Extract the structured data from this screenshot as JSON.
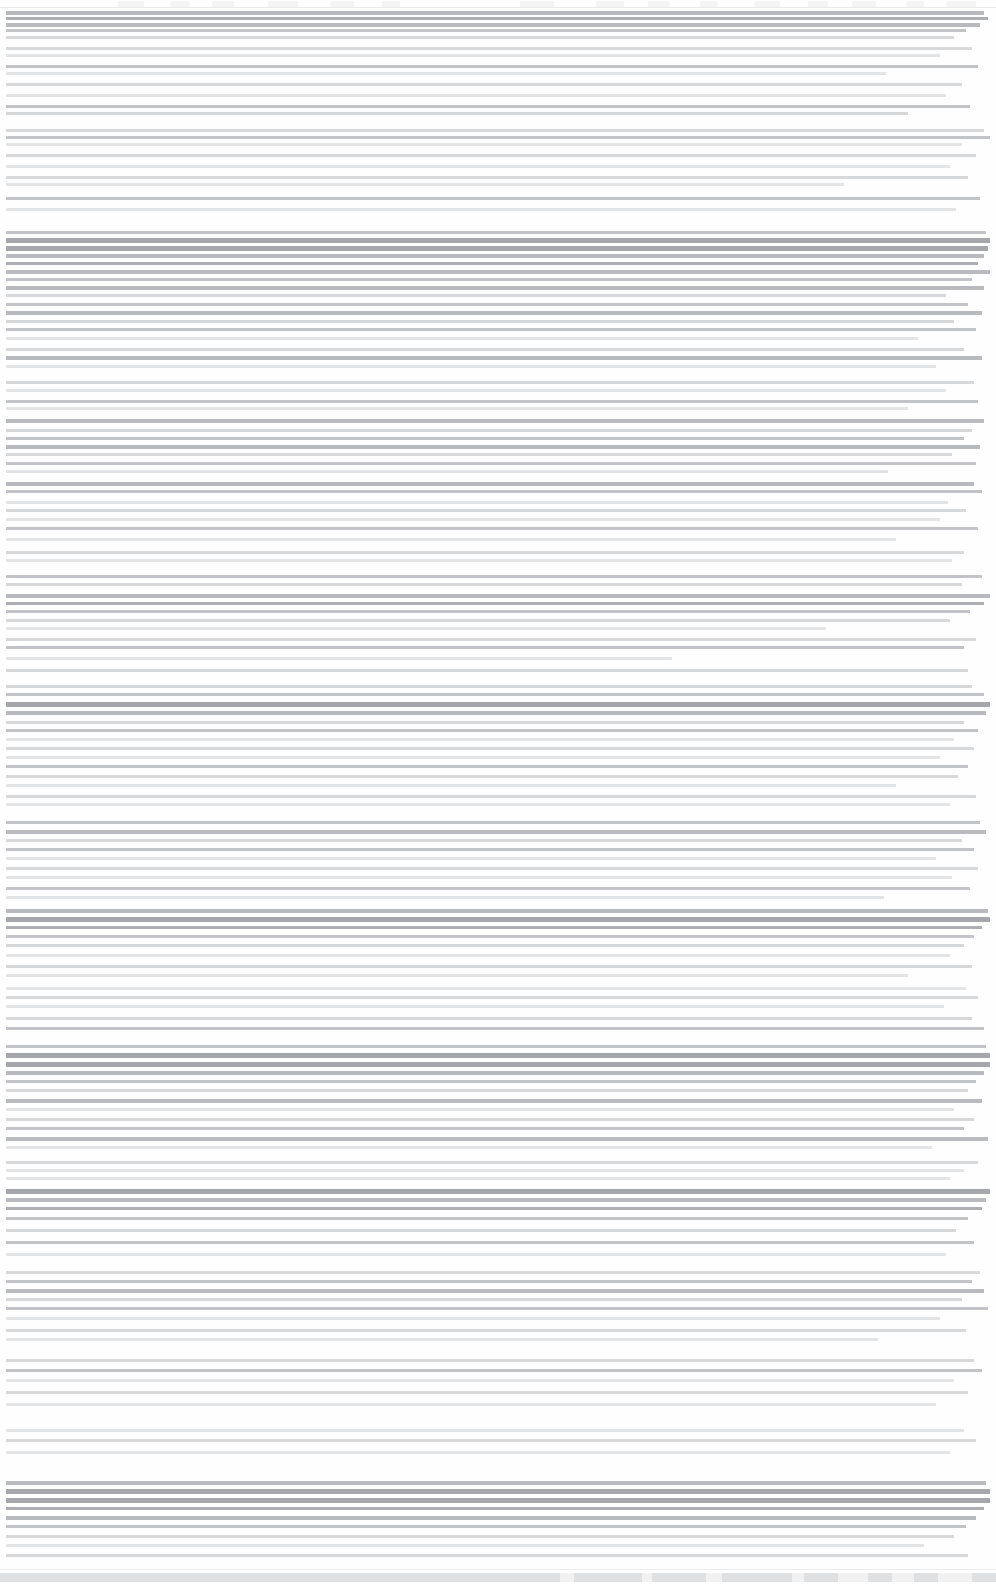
{
  "document": {
    "title": "",
    "legibility": "illegible",
    "note": "Severely degraded scan: all glyph detail lost to horizontal scanline compression; no text recoverable at any zoom level.",
    "page_width": 996,
    "page_height": 1585,
    "content_left": 6,
    "content_right": 988,
    "line_pitch": 11
  },
  "chrome": {
    "height": 9,
    "segments": [
      {
        "x": 118,
        "w": 26
      },
      {
        "x": 170,
        "w": 20
      },
      {
        "x": 212,
        "w": 22
      },
      {
        "x": 268,
        "w": 30
      },
      {
        "x": 330,
        "w": 24
      },
      {
        "x": 382,
        "w": 18
      },
      {
        "x": 520,
        "w": 34
      },
      {
        "x": 596,
        "w": 28
      },
      {
        "x": 648,
        "w": 22
      },
      {
        "x": 700,
        "w": 18
      },
      {
        "x": 754,
        "w": 26
      },
      {
        "x": 808,
        "w": 20
      },
      {
        "x": 852,
        "w": 24
      },
      {
        "x": 906,
        "w": 18
      },
      {
        "x": 946,
        "w": 30
      }
    ]
  },
  "footer": {
    "height": 16,
    "gaps": [
      {
        "x": 560,
        "w": 14
      },
      {
        "x": 642,
        "w": 10
      },
      {
        "x": 706,
        "w": 16
      },
      {
        "x": 792,
        "w": 12
      },
      {
        "x": 838,
        "w": 30
      },
      {
        "x": 892,
        "w": 22
      },
      {
        "x": 938,
        "w": 34
      }
    ]
  },
  "blocks": [
    {
      "name": "header-block",
      "top": 0,
      "lines": [
        {
          "y": 2,
          "w": 978,
          "t": "band"
        },
        {
          "y": 8,
          "w": 982,
          "t": "dark"
        },
        {
          "y": 14,
          "w": 974,
          "t": "band"
        },
        {
          "y": 20,
          "w": 960,
          "t": "mid"
        },
        {
          "y": 27,
          "w": 948,
          "t": "soft"
        },
        {
          "y": 38,
          "w": 966,
          "t": "soft"
        },
        {
          "y": 45,
          "w": 934,
          "t": "faint"
        },
        {
          "y": 56,
          "w": 972,
          "t": "mid"
        },
        {
          "y": 63,
          "w": 880,
          "t": "faint"
        },
        {
          "y": 74,
          "w": 956,
          "t": "soft"
        },
        {
          "y": 85,
          "w": 940,
          "t": "faint"
        },
        {
          "y": 96,
          "w": 964,
          "t": "mid"
        },
        {
          "y": 103,
          "w": 902,
          "t": "soft"
        }
      ]
    },
    {
      "name": "section-block-1",
      "top": 120,
      "lines": [
        {
          "y": 0,
          "w": 978,
          "t": "soft"
        },
        {
          "y": 7,
          "w": 984,
          "t": "mid"
        },
        {
          "y": 14,
          "w": 956,
          "t": "faint"
        },
        {
          "y": 25,
          "w": 970,
          "t": "soft"
        },
        {
          "y": 36,
          "w": 944,
          "t": "faint"
        },
        {
          "y": 47,
          "w": 962,
          "t": "soft"
        },
        {
          "y": 54,
          "w": 838,
          "t": "faint"
        },
        {
          "y": 68,
          "w": 974,
          "t": "mid"
        },
        {
          "y": 79,
          "w": 950,
          "t": "faint"
        }
      ]
    },
    {
      "name": "emphasis-band-1",
      "top": 222,
      "lines": [
        {
          "y": 0,
          "w": 980,
          "t": "mid"
        },
        {
          "y": 7,
          "w": 984,
          "t": "heavy"
        },
        {
          "y": 15,
          "w": 982,
          "t": "heavy"
        },
        {
          "y": 23,
          "w": 978,
          "t": "band"
        },
        {
          "y": 31,
          "w": 972,
          "t": "dark"
        },
        {
          "y": 39,
          "w": 984,
          "t": "band"
        },
        {
          "y": 47,
          "w": 966,
          "t": "mid"
        },
        {
          "y": 55,
          "w": 978,
          "t": "band"
        },
        {
          "y": 63,
          "w": 940,
          "t": "soft"
        },
        {
          "y": 72,
          "w": 962,
          "t": "mid"
        },
        {
          "y": 80,
          "w": 976,
          "t": "band"
        },
        {
          "y": 89,
          "w": 948,
          "t": "soft"
        },
        {
          "y": 97,
          "w": 970,
          "t": "mid"
        },
        {
          "y": 106,
          "w": 912,
          "t": "faint"
        },
        {
          "y": 117,
          "w": 958,
          "t": "soft"
        },
        {
          "y": 125,
          "w": 976,
          "t": "band"
        },
        {
          "y": 134,
          "w": 930,
          "t": "faint"
        }
      ]
    },
    {
      "name": "section-block-2",
      "top": 372,
      "lines": [
        {
          "y": 0,
          "w": 968,
          "t": "soft"
        },
        {
          "y": 8,
          "w": 940,
          "t": "faint"
        },
        {
          "y": 19,
          "w": 972,
          "t": "mid"
        },
        {
          "y": 26,
          "w": 902,
          "t": "faint"
        },
        {
          "y": 38,
          "w": 978,
          "t": "band"
        },
        {
          "y": 48,
          "w": 966,
          "t": "soft"
        },
        {
          "y": 56,
          "w": 958,
          "t": "mid"
        },
        {
          "y": 64,
          "w": 974,
          "t": "band"
        },
        {
          "y": 72,
          "w": 946,
          "t": "soft"
        },
        {
          "y": 81,
          "w": 970,
          "t": "mid"
        },
        {
          "y": 89,
          "w": 882,
          "t": "faint"
        },
        {
          "y": 101,
          "w": 968,
          "t": "band"
        },
        {
          "y": 109,
          "w": 976,
          "t": "mid"
        },
        {
          "y": 120,
          "w": 942,
          "t": "faint"
        },
        {
          "y": 128,
          "w": 960,
          "t": "soft"
        },
        {
          "y": 137,
          "w": 934,
          "t": "faint"
        },
        {
          "y": 146,
          "w": 972,
          "t": "mid"
        },
        {
          "y": 157,
          "w": 890,
          "t": "faint"
        },
        {
          "y": 170,
          "w": 958,
          "t": "soft"
        },
        {
          "y": 178,
          "w": 946,
          "t": "faint"
        }
      ]
    },
    {
      "name": "section-block-3",
      "top": 566,
      "lines": [
        {
          "y": 0,
          "w": 976,
          "t": "mid"
        },
        {
          "y": 8,
          "w": 956,
          "t": "soft"
        },
        {
          "y": 19,
          "w": 984,
          "t": "band"
        },
        {
          "y": 27,
          "w": 978,
          "t": "dark"
        },
        {
          "y": 35,
          "w": 964,
          "t": "mid"
        },
        {
          "y": 44,
          "w": 944,
          "t": "soft"
        },
        {
          "y": 52,
          "w": 820,
          "t": "faint"
        },
        {
          "y": 63,
          "w": 970,
          "t": "soft"
        },
        {
          "y": 71,
          "w": 958,
          "t": "mid"
        },
        {
          "y": 82,
          "w": 666,
          "t": "faint"
        },
        {
          "y": 94,
          "w": 962,
          "t": "soft"
        }
      ]
    },
    {
      "name": "section-block-4",
      "top": 676,
      "lines": [
        {
          "y": 0,
          "w": 966,
          "t": "soft"
        },
        {
          "y": 8,
          "w": 978,
          "t": "mid"
        },
        {
          "y": 17,
          "w": 984,
          "t": "heavy"
        },
        {
          "y": 26,
          "w": 980,
          "t": "band"
        },
        {
          "y": 36,
          "w": 958,
          "t": "soft"
        },
        {
          "y": 44,
          "w": 972,
          "t": "mid"
        },
        {
          "y": 53,
          "w": 948,
          "t": "faint"
        },
        {
          "y": 62,
          "w": 968,
          "t": "soft"
        },
        {
          "y": 71,
          "w": 934,
          "t": "faint"
        },
        {
          "y": 80,
          "w": 962,
          "t": "mid"
        },
        {
          "y": 90,
          "w": 952,
          "t": "soft"
        },
        {
          "y": 99,
          "w": 890,
          "t": "faint"
        },
        {
          "y": 110,
          "w": 970,
          "t": "soft"
        },
        {
          "y": 118,
          "w": 944,
          "t": "faint"
        }
      ]
    },
    {
      "name": "section-block-5",
      "top": 812,
      "lines": [
        {
          "y": 0,
          "w": 974,
          "t": "mid"
        },
        {
          "y": 9,
          "w": 980,
          "t": "band"
        },
        {
          "y": 18,
          "w": 956,
          "t": "soft"
        },
        {
          "y": 27,
          "w": 968,
          "t": "mid"
        },
        {
          "y": 36,
          "w": 930,
          "t": "faint"
        },
        {
          "y": 46,
          "w": 972,
          "t": "soft"
        },
        {
          "y": 55,
          "w": 946,
          "t": "faint"
        },
        {
          "y": 66,
          "w": 964,
          "t": "mid"
        },
        {
          "y": 75,
          "w": 878,
          "t": "faint"
        }
      ]
    },
    {
      "name": "emphasis-band-2",
      "top": 900,
      "lines": [
        {
          "y": 0,
          "w": 982,
          "t": "band"
        },
        {
          "y": 8,
          "w": 984,
          "t": "heavy"
        },
        {
          "y": 17,
          "w": 976,
          "t": "dark"
        },
        {
          "y": 26,
          "w": 968,
          "t": "mid"
        },
        {
          "y": 35,
          "w": 958,
          "t": "soft"
        },
        {
          "y": 45,
          "w": 944,
          "t": "faint"
        },
        {
          "y": 56,
          "w": 966,
          "t": "soft"
        },
        {
          "y": 65,
          "w": 902,
          "t": "faint"
        }
      ]
    },
    {
      "name": "section-block-6",
      "top": 978,
      "lines": [
        {
          "y": 0,
          "w": 960,
          "t": "faint"
        },
        {
          "y": 9,
          "w": 972,
          "t": "soft"
        },
        {
          "y": 18,
          "w": 938,
          "t": "faint"
        },
        {
          "y": 30,
          "w": 966,
          "t": "soft"
        },
        {
          "y": 40,
          "w": 978,
          "t": "mid"
        }
      ]
    },
    {
      "name": "emphasis-band-3",
      "top": 1036,
      "lines": [
        {
          "y": 0,
          "w": 980,
          "t": "mid"
        },
        {
          "y": 8,
          "w": 984,
          "t": "heavy"
        },
        {
          "y": 17,
          "w": 984,
          "t": "heavy"
        },
        {
          "y": 26,
          "w": 978,
          "t": "band"
        },
        {
          "y": 35,
          "w": 970,
          "t": "mid"
        },
        {
          "y": 44,
          "w": 962,
          "t": "soft"
        },
        {
          "y": 54,
          "w": 976,
          "t": "band"
        },
        {
          "y": 63,
          "w": 948,
          "t": "faint"
        },
        {
          "y": 73,
          "w": 968,
          "t": "soft"
        },
        {
          "y": 82,
          "w": 958,
          "t": "mid"
        },
        {
          "y": 92,
          "w": 982,
          "t": "band"
        },
        {
          "y": 101,
          "w": 926,
          "t": "faint"
        }
      ]
    },
    {
      "name": "section-block-7",
      "top": 1152,
      "lines": [
        {
          "y": 0,
          "w": 972,
          "t": "soft"
        },
        {
          "y": 8,
          "w": 958,
          "t": "faint"
        },
        {
          "y": 16,
          "w": 944,
          "t": "faint"
        },
        {
          "y": 28,
          "w": 984,
          "t": "heavy"
        },
        {
          "y": 37,
          "w": 980,
          "t": "band"
        },
        {
          "y": 46,
          "w": 976,
          "t": "dark"
        },
        {
          "y": 56,
          "w": 962,
          "t": "mid"
        },
        {
          "y": 68,
          "w": 950,
          "t": "soft"
        },
        {
          "y": 80,
          "w": 968,
          "t": "mid"
        },
        {
          "y": 92,
          "w": 940,
          "t": "faint"
        }
      ]
    },
    {
      "name": "section-block-8",
      "top": 1262,
      "lines": [
        {
          "y": 0,
          "w": 974,
          "t": "soft"
        },
        {
          "y": 9,
          "w": 966,
          "t": "mid"
        },
        {
          "y": 18,
          "w": 978,
          "t": "band"
        },
        {
          "y": 27,
          "w": 956,
          "t": "soft"
        },
        {
          "y": 36,
          "w": 982,
          "t": "mid"
        },
        {
          "y": 46,
          "w": 934,
          "t": "faint"
        },
        {
          "y": 58,
          "w": 960,
          "t": "soft"
        },
        {
          "y": 67,
          "w": 872,
          "t": "faint"
        }
      ]
    },
    {
      "name": "section-block-9",
      "top": 1350,
      "lines": [
        {
          "y": 0,
          "w": 968,
          "t": "soft"
        },
        {
          "y": 10,
          "w": 976,
          "t": "mid"
        },
        {
          "y": 20,
          "w": 948,
          "t": "faint"
        },
        {
          "y": 32,
          "w": 962,
          "t": "soft"
        },
        {
          "y": 44,
          "w": 930,
          "t": "faint"
        }
      ]
    },
    {
      "name": "section-block-10",
      "top": 1420,
      "lines": [
        {
          "y": 0,
          "w": 958,
          "t": "faint"
        },
        {
          "y": 10,
          "w": 970,
          "t": "soft"
        },
        {
          "y": 22,
          "w": 944,
          "t": "faint"
        }
      ]
    },
    {
      "name": "emphasis-band-4",
      "top": 1472,
      "lines": [
        {
          "y": 0,
          "w": 980,
          "t": "band"
        },
        {
          "y": 8,
          "w": 984,
          "t": "heavy"
        },
        {
          "y": 17,
          "w": 984,
          "t": "heavy"
        },
        {
          "y": 26,
          "w": 978,
          "t": "dark"
        },
        {
          "y": 35,
          "w": 970,
          "t": "band"
        },
        {
          "y": 44,
          "w": 960,
          "t": "mid"
        },
        {
          "y": 54,
          "w": 948,
          "t": "soft"
        },
        {
          "y": 63,
          "w": 918,
          "t": "faint"
        },
        {
          "y": 73,
          "w": 962,
          "t": "soft"
        }
      ]
    }
  ]
}
